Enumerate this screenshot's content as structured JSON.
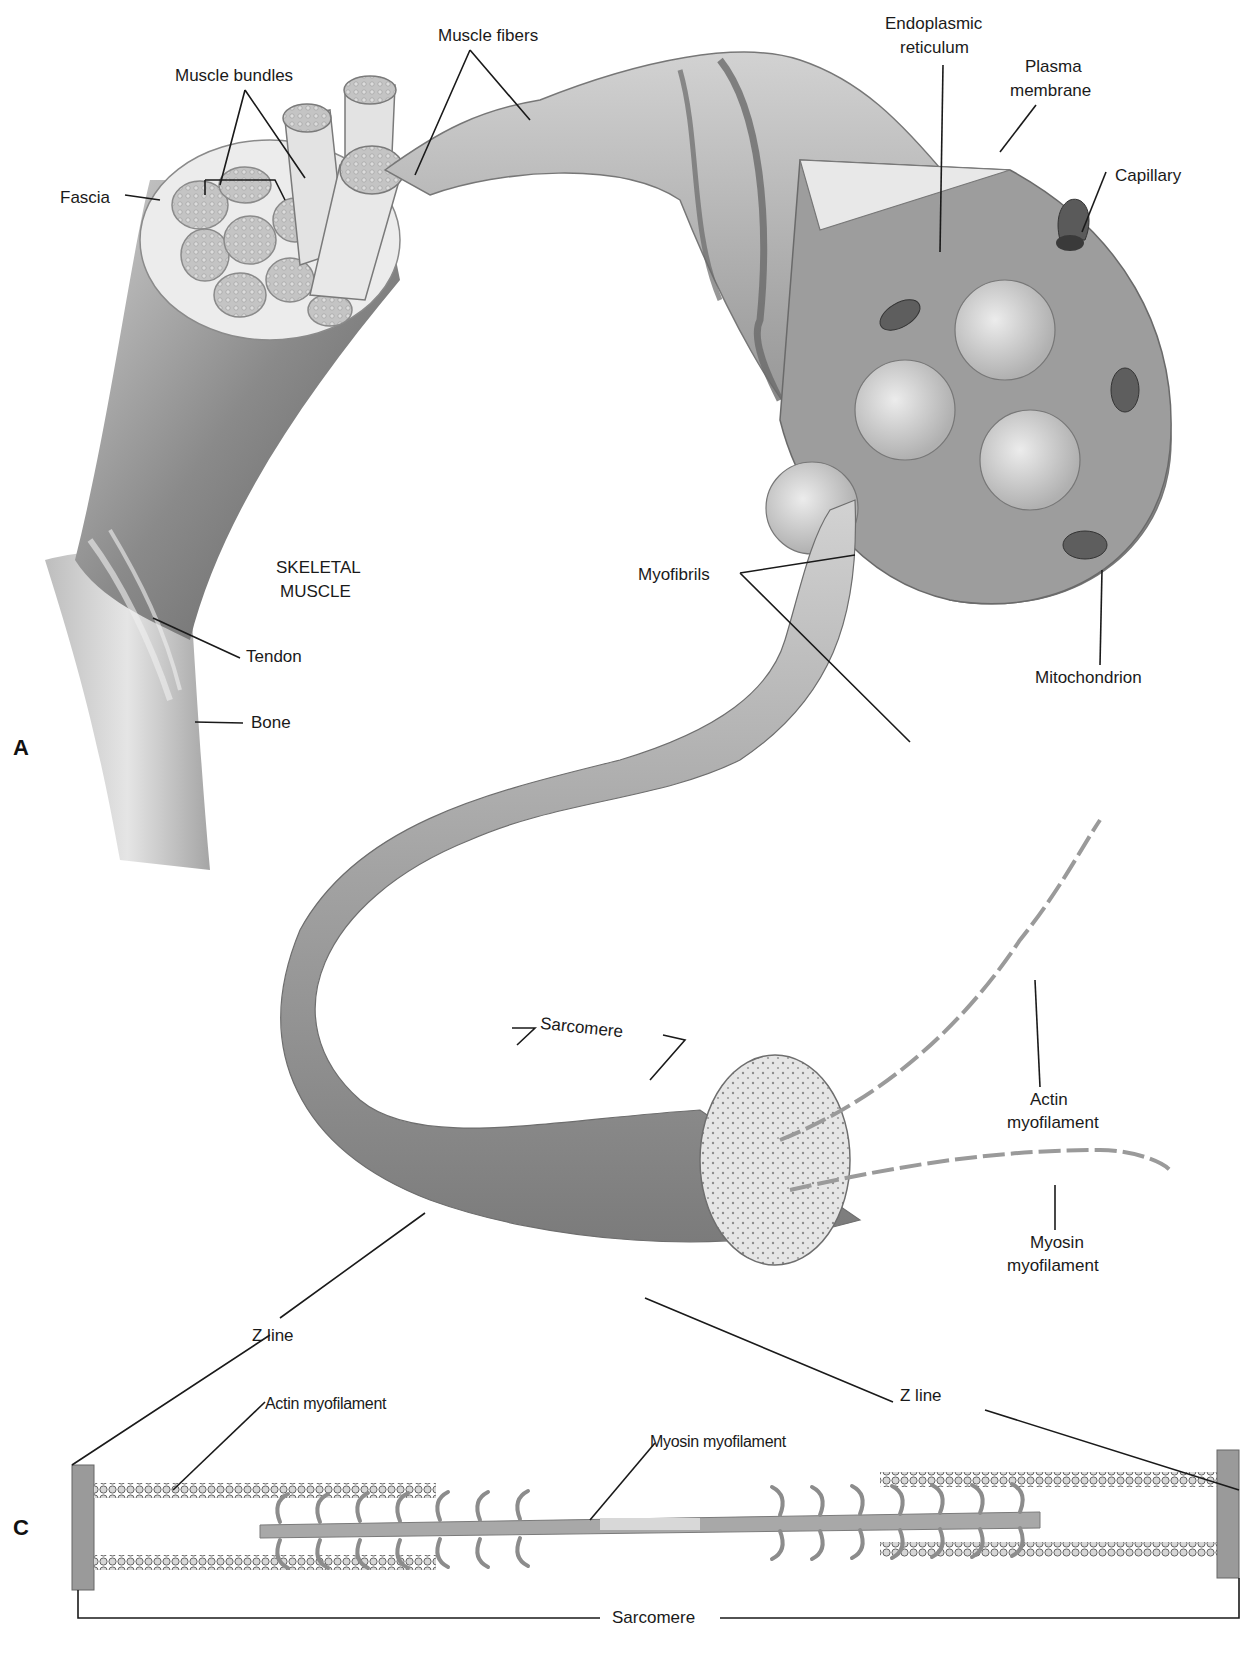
{
  "figure": {
    "panels": [
      {
        "id": "A",
        "letter": "A"
      },
      {
        "id": "C",
        "letter": "C"
      }
    ],
    "title_label": "SKELETAL\nMUSCLE"
  },
  "labels": {
    "muscle_bundles": "Muscle bundles",
    "muscle_fibers": "Muscle fibers",
    "fascia": "Fascia",
    "endoplasmic_reticulum": "Endoplasmic reticulum",
    "plasma_membrane": "Plasma membrane",
    "capillary": "Capillary",
    "skeletal_muscle_line1": "SKELETAL",
    "skeletal_muscle_line2": "MUSCLE",
    "myofibrils": "Myofibrils",
    "tendon": "Tendon",
    "bone": "Bone",
    "mitochondrion": "Mitochondrion",
    "sarcomere_upper": "Sarcomere",
    "actin_myofilament_upper_1": "Actin",
    "actin_myofilament_upper_2": "myofilament",
    "myosin_myofilament_upper_1": "Myosin",
    "myosin_myofilament_upper_2": "myofilament",
    "z_line_left": "Z line",
    "z_line_right": "Z line",
    "actin_myofilament_lower": "Actin myofilament",
    "myosin_myofilament_lower": "Myosin myofilament",
    "sarcomere_lower": "Sarcomere",
    "endoplasmic_line1": "Endoplasmic",
    "endoplasmic_line2": "reticulum",
    "plasma_line1": "Plasma",
    "plasma_line2": "membrane"
  },
  "colors": {
    "background": "#ffffff",
    "ink": "#1a1a1a",
    "tissue_light": "#d9d9d9",
    "tissue_mid": "#a8a8a8",
    "tissue_dark": "#6e6e6e",
    "z_disc": "#9a9a9a"
  }
}
